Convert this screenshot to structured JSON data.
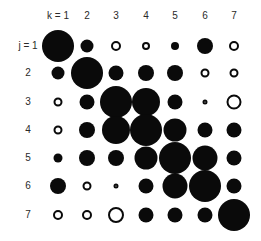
{
  "chart_data": {
    "type": "heatmap",
    "subtype": "bubble-correlation-matrix",
    "title": "",
    "column_axis_label": "k",
    "row_axis_label": "j",
    "column_labels": [
      "k = 1",
      "2",
      "3",
      "4",
      "5",
      "6",
      "7"
    ],
    "row_labels": [
      "j = 1",
      "2",
      "3",
      "4",
      "5",
      "6",
      "7"
    ],
    "encoding": {
      "size": "magnitude (circle diameter, px)",
      "fill": "filled = positive, open = negative"
    },
    "colors": {
      "ink": "#0a0a0a",
      "background": "#ffffff"
    },
    "cells": [
      [
        {
          "d": 32,
          "sign": "+"
        },
        {
          "d": 13,
          "sign": "+"
        },
        {
          "d": 10,
          "sign": "-"
        },
        {
          "d": 8,
          "sign": "-"
        },
        {
          "d": 8,
          "sign": "+"
        },
        {
          "d": 16,
          "sign": "+"
        },
        {
          "d": 10,
          "sign": "-"
        }
      ],
      [
        {
          "d": 13,
          "sign": "+"
        },
        {
          "d": 32,
          "sign": "+"
        },
        {
          "d": 15,
          "sign": "+"
        },
        {
          "d": 16,
          "sign": "+"
        },
        {
          "d": 16,
          "sign": "+"
        },
        {
          "d": 9,
          "sign": "-"
        },
        {
          "d": 9,
          "sign": "-"
        }
      ],
      [
        {
          "d": 9,
          "sign": "-"
        },
        {
          "d": 15,
          "sign": "+"
        },
        {
          "d": 32,
          "sign": "+"
        },
        {
          "d": 28,
          "sign": "+"
        },
        {
          "d": 15,
          "sign": "+"
        },
        {
          "d": 5,
          "sign": "-"
        },
        {
          "d": 15,
          "sign": "-"
        }
      ],
      [
        {
          "d": 9,
          "sign": "-"
        },
        {
          "d": 16,
          "sign": "+"
        },
        {
          "d": 28,
          "sign": "+"
        },
        {
          "d": 32,
          "sign": "+"
        },
        {
          "d": 23,
          "sign": "+"
        },
        {
          "d": 15,
          "sign": "+"
        },
        {
          "d": 15,
          "sign": "+"
        }
      ],
      [
        {
          "d": 9,
          "sign": "+"
        },
        {
          "d": 16,
          "sign": "+"
        },
        {
          "d": 16,
          "sign": "+"
        },
        {
          "d": 23,
          "sign": "+"
        },
        {
          "d": 32,
          "sign": "+"
        },
        {
          "d": 25,
          "sign": "+"
        },
        {
          "d": 15,
          "sign": "+"
        }
      ],
      [
        {
          "d": 16,
          "sign": "+"
        },
        {
          "d": 9,
          "sign": "-"
        },
        {
          "d": 5,
          "sign": "-"
        },
        {
          "d": 15,
          "sign": "+"
        },
        {
          "d": 25,
          "sign": "+"
        },
        {
          "d": 32,
          "sign": "+"
        },
        {
          "d": 15,
          "sign": "+"
        }
      ],
      [
        {
          "d": 10,
          "sign": "-"
        },
        {
          "d": 10,
          "sign": "-"
        },
        {
          "d": 16,
          "sign": "-"
        },
        {
          "d": 15,
          "sign": "+"
        },
        {
          "d": 15,
          "sign": "+"
        },
        {
          "d": 15,
          "sign": "+"
        },
        {
          "d": 32,
          "sign": "+"
        }
      ]
    ],
    "layout": {
      "col_x": [
        58,
        87,
        116,
        146,
        175,
        205,
        234
      ],
      "row_y": [
        46,
        73,
        102,
        130,
        158,
        186,
        215
      ],
      "header_y": 16,
      "row_label_x": 28,
      "grid": false,
      "legend": false
    }
  }
}
